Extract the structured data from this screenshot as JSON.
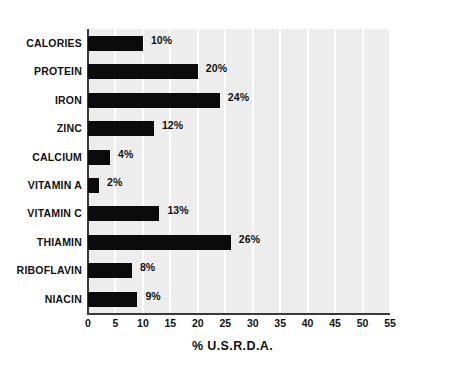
{
  "chart_data": {
    "type": "bar",
    "orientation": "horizontal",
    "title": "",
    "xlabel": "% U.S.R.D.A.",
    "ylabel": "",
    "xlim": [
      0,
      55
    ],
    "xticks": [
      0,
      5,
      10,
      15,
      20,
      25,
      30,
      35,
      40,
      45,
      50,
      55
    ],
    "xtick_labels": [
      "0",
      "5",
      "10",
      "15",
      "20",
      "25",
      "30",
      "35",
      "40",
      "45",
      "50",
      "55"
    ],
    "grid": true,
    "grid_axis": "x",
    "legend": null,
    "categories": [
      "CALORIES",
      "PROTEIN",
      "IRON",
      "ZINC",
      "CALCIUM",
      "VITAMIN A",
      "VITAMIN C",
      "THIAMIN",
      "RIBOFLAVIN",
      "NIACIN"
    ],
    "values": [
      10,
      20,
      24,
      12,
      4,
      2,
      13,
      26,
      8,
      9
    ],
    "value_labels": [
      "10%",
      "20%",
      "24%",
      "12%",
      "4%",
      "2%",
      "13%",
      "26%",
      "8%",
      "9%"
    ],
    "bar_color": "#0b0b0b",
    "plot_background": "#ededed",
    "gridline_color": "#ffffff",
    "axis_color": "#3a3a3a",
    "page_background": "#ffffff"
  }
}
